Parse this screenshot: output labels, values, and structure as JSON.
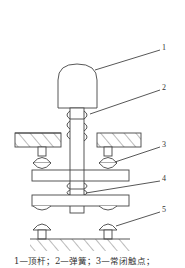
{
  "figure": {
    "type": "pushbutton-switch-cross-section",
    "callouts": [
      {
        "id": "1",
        "label": "1"
      },
      {
        "id": "2",
        "label": "2"
      },
      {
        "id": "3",
        "label": "3"
      },
      {
        "id": "4",
        "label": "4"
      },
      {
        "id": "5",
        "label": "5"
      }
    ],
    "caption": "1—顶杆；2—弹簧；3—常闭触点；",
    "stroke_color": "#444444"
  }
}
